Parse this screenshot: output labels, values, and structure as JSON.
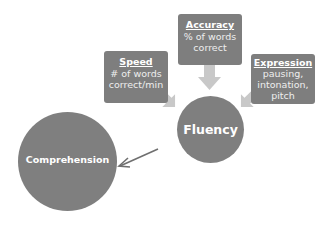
{
  "diagram": {
    "center": {
      "label": "Fluency"
    },
    "inputs": [
      {
        "title": "Speed",
        "description": "# of words correct/min"
      },
      {
        "title": "Accuracy",
        "description": "% of words correct"
      },
      {
        "title": "Expression",
        "description": "pausing, intonation, pitch"
      }
    ],
    "output": {
      "label": "Comprehension"
    }
  },
  "colors": {
    "node_fill": "#7e7e7e",
    "node_text": "#ffffff",
    "input_arrow": "#c8c8c8",
    "output_arrow": "#6f6f6f",
    "background": "#ffffff"
  }
}
